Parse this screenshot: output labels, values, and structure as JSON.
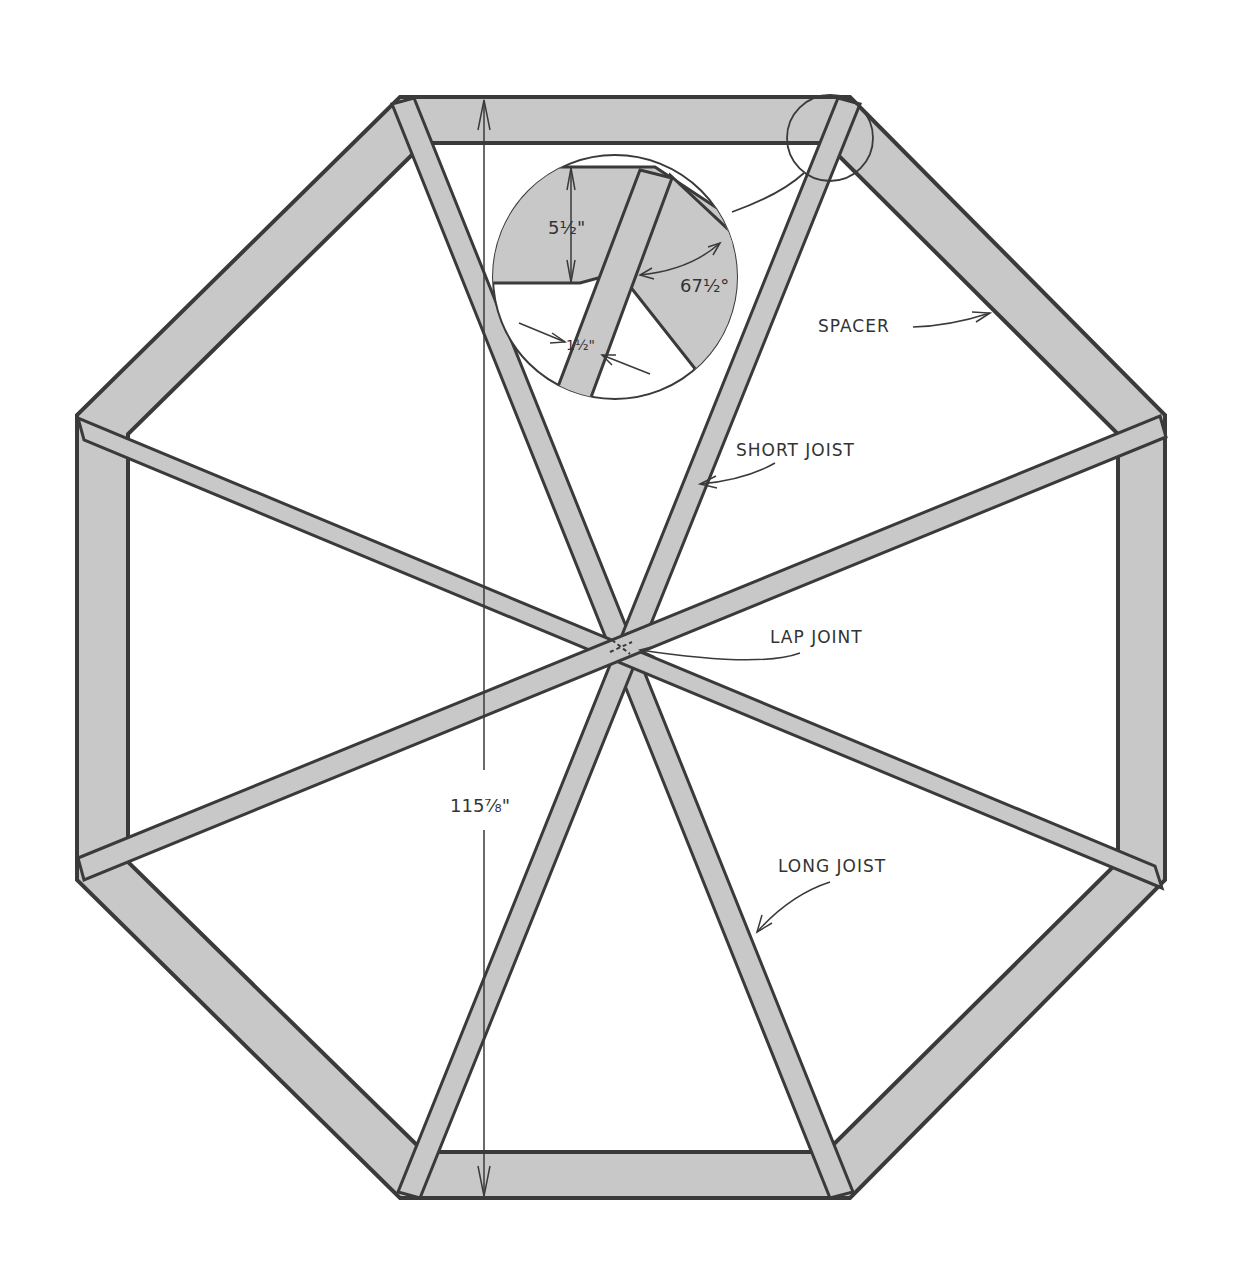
{
  "colors": {
    "wood_fill": "#c8c8c8",
    "outline": "#3a3a3a",
    "background": "#ffffff"
  },
  "labels": {
    "spacer": "SPACER",
    "short_joist": "SHORT JOIST",
    "lap_joint": "LAP JOINT",
    "long_joist": "LONG JOIST"
  },
  "dimensions": {
    "overall_height": "115⅞\"",
    "spacer_width": "5½\"",
    "joist_thickness": "1½\"",
    "miter_angle": "67½°"
  },
  "detail": {
    "name": "corner-detail-callout"
  }
}
